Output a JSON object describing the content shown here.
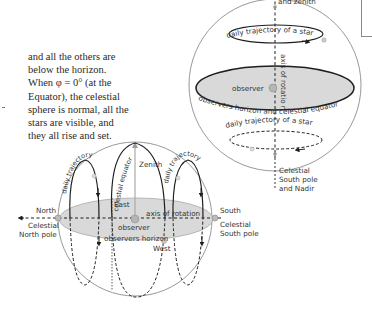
{
  "paragraph": {
    "lines": [
      "and all the others are",
      "below the horizon.",
      "When φ = 0° (at the",
      "Equator), the celestial",
      "sphere is normal, all the",
      "stars are visible, and",
      "they all rise and set."
    ]
  },
  "right_sphere": {
    "top_label_partial": "and zenith",
    "upper_trajectory": "daily trajectory of a star",
    "lower_trajectory": "daily trajectory of a star",
    "axis": "axis of rotatio n",
    "observer": "observer",
    "horizon_equator": "observers horizon and celestial equator",
    "bottom_label": [
      "Celestial",
      "South pole",
      "and Nadir"
    ]
  },
  "left_sphere": {
    "zenith": "Zenith",
    "north": "North",
    "north_pole": [
      "Celestial",
      "North pole"
    ],
    "south": "South",
    "south_pole": [
      "Celestial",
      "South pole"
    ],
    "east": "East",
    "west": "West",
    "observer": "observer",
    "horizon": "observers horizon",
    "axis": "axis of rotation",
    "celestial_equator": "celestial equator",
    "left_trajectory": "daily trajectory of a star",
    "right_trajectory": "daily trajectory of a star"
  },
  "colors": {
    "line": "#1e1e1e",
    "sphere_outline": "#8c8c8c",
    "disk_fill": "#d9d9d9",
    "text": "#2a2a2a",
    "dot_fill": "#b5b5b5"
  }
}
